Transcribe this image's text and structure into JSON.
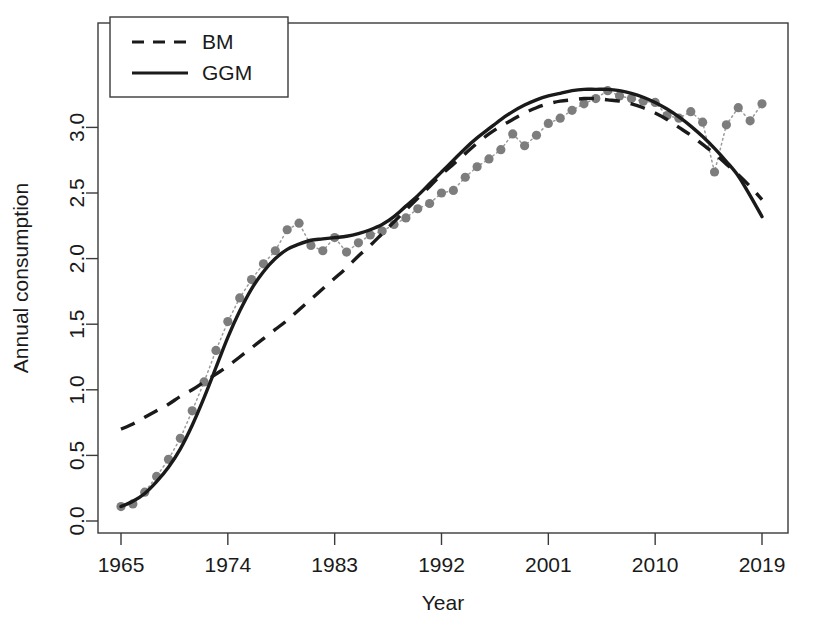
{
  "chart_data": {
    "type": "line",
    "title": "",
    "xlabel": "Year",
    "ylabel": "Annual consumption",
    "xlim": [
      1965,
      2019
    ],
    "ylim": [
      0.0,
      3.4
    ],
    "xticks": [
      1965,
      1974,
      1983,
      1992,
      2001,
      2010,
      2019
    ],
    "xtick_labels": [
      "1965",
      "1974",
      "1983",
      "1992",
      "2001",
      "2010",
      "2019"
    ],
    "yticks": [
      0.0,
      0.5,
      1.0,
      1.5,
      2.0,
      2.5,
      3.0
    ],
    "ytick_labels": [
      "0.0",
      "0.5",
      "1.0",
      "1.5",
      "2.0",
      "2.5",
      "3.0"
    ],
    "grid": false,
    "legend_position": "top-left",
    "legend_entries": [
      {
        "label": "BM",
        "style": "dashed",
        "color": "#1a1a1a"
      },
      {
        "label": "GGM",
        "style": "solid",
        "color": "#1a1a1a"
      }
    ],
    "x": [
      1965,
      1966,
      1967,
      1968,
      1969,
      1970,
      1971,
      1972,
      1973,
      1974,
      1975,
      1976,
      1977,
      1978,
      1979,
      1980,
      1981,
      1982,
      1983,
      1984,
      1985,
      1986,
      1987,
      1988,
      1989,
      1990,
      1991,
      1992,
      1993,
      1994,
      1995,
      1996,
      1997,
      1998,
      1999,
      2000,
      2001,
      2002,
      2003,
      2004,
      2005,
      2006,
      2007,
      2008,
      2009,
      2010,
      2011,
      2012,
      2013,
      2014,
      2015,
      2016,
      2017,
      2018,
      2019
    ],
    "series": [
      {
        "name": "Observed",
        "style": "points-dotted",
        "color": "#7d7d7d",
        "values": [
          0.11,
          0.13,
          0.22,
          0.34,
          0.47,
          0.63,
          0.84,
          1.06,
          1.3,
          1.52,
          1.7,
          1.84,
          1.96,
          2.06,
          2.22,
          2.27,
          2.1,
          2.06,
          2.16,
          2.05,
          2.12,
          2.18,
          2.21,
          2.26,
          2.31,
          2.38,
          2.42,
          2.5,
          2.52,
          2.62,
          2.7,
          2.76,
          2.83,
          2.95,
          2.86,
          2.94,
          3.03,
          3.07,
          3.13,
          3.18,
          3.22,
          3.28,
          3.24,
          3.22,
          3.2,
          3.19,
          3.09,
          3.07,
          3.12,
          3.04,
          2.66,
          3.02,
          3.15,
          3.05,
          3.18
        ]
      },
      {
        "name": "BM",
        "style": "dashed",
        "color": "#1a1a1a",
        "values": [
          0.7,
          0.74,
          0.79,
          0.84,
          0.89,
          0.95,
          1.0,
          1.06,
          1.12,
          1.18,
          1.25,
          1.32,
          1.39,
          1.46,
          1.53,
          1.61,
          1.69,
          1.77,
          1.85,
          1.93,
          2.02,
          2.1,
          2.19,
          2.28,
          2.37,
          2.46,
          2.55,
          2.64,
          2.72,
          2.8,
          2.88,
          2.95,
          3.01,
          3.06,
          3.11,
          3.15,
          3.18,
          3.2,
          3.21,
          3.22,
          3.22,
          3.21,
          3.2,
          3.18,
          3.15,
          3.11,
          3.06,
          3.0,
          2.94,
          2.87,
          2.8,
          2.72,
          2.64,
          2.55,
          2.45
        ]
      },
      {
        "name": "GGM",
        "style": "solid",
        "color": "#1a1a1a",
        "values": [
          0.11,
          0.15,
          0.21,
          0.3,
          0.41,
          0.55,
          0.73,
          0.94,
          1.17,
          1.4,
          1.6,
          1.77,
          1.9,
          2.0,
          2.07,
          2.11,
          2.14,
          2.15,
          2.16,
          2.17,
          2.19,
          2.22,
          2.26,
          2.32,
          2.4,
          2.48,
          2.57,
          2.66,
          2.75,
          2.84,
          2.92,
          2.99,
          3.06,
          3.12,
          3.17,
          3.21,
          3.24,
          3.26,
          3.28,
          3.29,
          3.29,
          3.29,
          3.28,
          3.26,
          3.23,
          3.19,
          3.14,
          3.08,
          3.01,
          2.93,
          2.84,
          2.74,
          2.63,
          2.48,
          2.32
        ]
      }
    ]
  }
}
